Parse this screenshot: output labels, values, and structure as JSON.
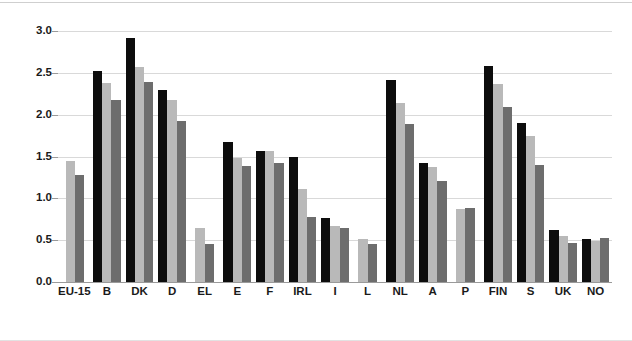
{
  "chart_data": {
    "type": "bar",
    "title": "",
    "subtitle": "",
    "xlabel": "",
    "ylabel": "",
    "ylim": [
      0.0,
      3.0
    ],
    "grid": true,
    "legend_position": "none",
    "y_ticks": [
      "0.0",
      "0.5",
      "1.0",
      "1.5",
      "2.0",
      "2.5",
      "3.0"
    ],
    "y_tick_values": [
      0.0,
      0.5,
      1.0,
      1.5,
      2.0,
      2.5,
      3.0
    ],
    "categories": [
      "EU-15",
      "B",
      "DK",
      "D",
      "EL",
      "E",
      "F",
      "IRL",
      "I",
      "L",
      "NL",
      "A",
      "P",
      "FIN",
      "S",
      "UK",
      "NO"
    ],
    "series": [
      {
        "name": "Series 1",
        "color": "#0d0d0d",
        "values": [
          null,
          2.52,
          2.92,
          2.3,
          null,
          1.67,
          1.56,
          1.5,
          0.76,
          null,
          2.42,
          1.42,
          null,
          2.58,
          1.9,
          0.62,
          0.51
        ]
      },
      {
        "name": "Series 2",
        "color": "#b9b9b9",
        "values": [
          1.45,
          2.38,
          2.57,
          2.17,
          0.65,
          1.48,
          1.57,
          1.11,
          0.67,
          0.52,
          2.14,
          1.37,
          0.87,
          2.37,
          1.75,
          0.55,
          0.49
        ]
      },
      {
        "name": "Series 3",
        "color": "#6d6d6d",
        "values": [
          1.28,
          2.18,
          2.39,
          1.92,
          0.46,
          1.39,
          1.42,
          0.78,
          0.64,
          0.46,
          1.89,
          1.21,
          0.88,
          2.09,
          1.4,
          0.47,
          0.53
        ]
      }
    ],
    "colors": {
      "series_1": "#0d0d0d",
      "series_2": "#b9b9b9",
      "series_3": "#6d6d6d",
      "gridline": "#d9d9d9",
      "axis": "#9a9a9a",
      "background": "#ffffff",
      "text": "#1a1a1a"
    }
  }
}
